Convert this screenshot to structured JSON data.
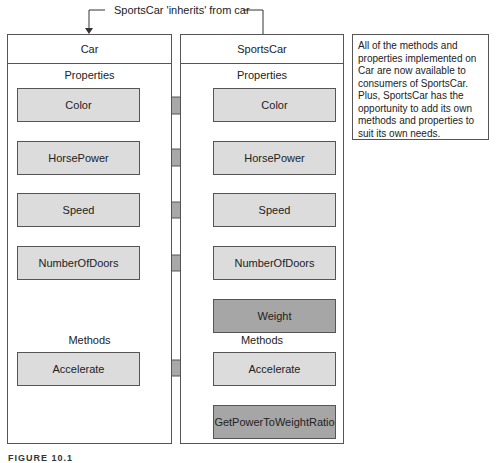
{
  "inheritance_label": "SportsCar 'inherits' from car",
  "base_class": {
    "name": "Car",
    "properties_label": "Properties",
    "properties": [
      "Color",
      "HorsePower",
      "Speed",
      "NumberOfDoors"
    ],
    "methods_label": "Methods",
    "methods": [
      "Accelerate"
    ]
  },
  "derived_class": {
    "name": "SportsCar",
    "properties_label": "Properties",
    "inherited_properties": [
      "Color",
      "HorsePower",
      "Speed",
      "NumberOfDoors"
    ],
    "new_properties": [
      "Weight"
    ],
    "methods_label": "Methods",
    "inherited_methods": [
      "Accelerate"
    ],
    "new_methods": [
      "GetPowerToWeightRatio"
    ]
  },
  "note": "All of the methods and properties implemented on Car are now available to consumers of SportsCar. Plus, SportsCar has the opportunity to add its own methods and properties to suit its own needs.",
  "caption": "FIGURE 10.1",
  "colors": {
    "inherited_member_fill": "#dcdcdc",
    "new_member_fill": "#a6a6a6",
    "arrow_fill": "#a8a8a8",
    "border": "#555555"
  }
}
